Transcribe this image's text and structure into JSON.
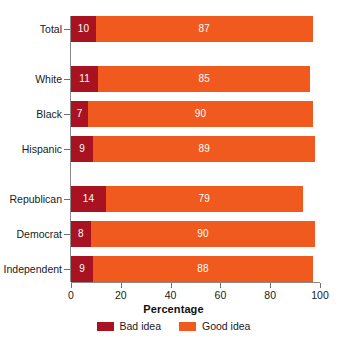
{
  "chart_data": {
    "type": "bar",
    "orientation": "horizontal",
    "stacked": true,
    "title": "",
    "xlabel": "Percentage",
    "ylabel": "",
    "xlim": [
      0,
      100
    ],
    "xticks": [
      0,
      20,
      40,
      60,
      80,
      100
    ],
    "grid": false,
    "legend_position": "bottom-center",
    "categories": [
      "Total",
      "White",
      "Black",
      "Hispanic",
      "Republican",
      "Democrat",
      "Independent"
    ],
    "group_breaks_after": [
      "Total",
      "Hispanic"
    ],
    "series": [
      {
        "name": "Bad idea",
        "color": "#A81221",
        "values": [
          10,
          11,
          7,
          9,
          14,
          8,
          9
        ]
      },
      {
        "name": "Good idea",
        "color": "#F05A1E",
        "values": [
          87,
          85,
          90,
          89,
          79,
          90,
          88
        ]
      }
    ]
  },
  "legend": {
    "items": [
      {
        "label": "Bad idea",
        "color": "#A81221"
      },
      {
        "label": "Good idea",
        "color": "#F05A1E"
      }
    ]
  },
  "axis": {
    "x_title": "Percentage",
    "tick_labels": [
      "0",
      "20",
      "40",
      "60",
      "80",
      "100"
    ]
  },
  "colors": {
    "bad_idea": "#A81221",
    "good_idea": "#F05A1E",
    "axis_line": "#8a8a8a",
    "tick_mark": "#6f6f6f",
    "text": "#1a1a1a",
    "background": "#ffffff",
    "data_label": "#ffffff"
  }
}
